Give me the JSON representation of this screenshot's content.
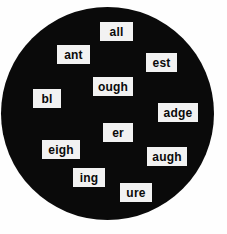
{
  "canvas": {
    "width": 227,
    "height": 234,
    "background_color": "#fefefe"
  },
  "circle": {
    "label": "black-circle-background",
    "color": "#0a0a0a",
    "center_x": 107,
    "center_y": 113,
    "diameter": 213
  },
  "tiles": [
    {
      "text": "all",
      "x": 100,
      "y": 22,
      "w": 33,
      "h": 19
    },
    {
      "text": "ant",
      "x": 57,
      "y": 45,
      "w": 33,
      "h": 19
    },
    {
      "text": "est",
      "x": 146,
      "y": 53,
      "w": 31,
      "h": 19
    },
    {
      "text": "ough",
      "x": 93,
      "y": 77,
      "w": 40,
      "h": 19
    },
    {
      "text": "bl",
      "x": 33,
      "y": 89,
      "w": 28,
      "h": 19
    },
    {
      "text": "adge",
      "x": 158,
      "y": 103,
      "w": 40,
      "h": 19
    },
    {
      "text": "er",
      "x": 103,
      "y": 123,
      "w": 30,
      "h": 19
    },
    {
      "text": "eigh",
      "x": 42,
      "y": 140,
      "w": 38,
      "h": 19
    },
    {
      "text": "augh",
      "x": 147,
      "y": 147,
      "w": 40,
      "h": 19
    },
    {
      "text": "ing",
      "x": 73,
      "y": 168,
      "w": 32,
      "h": 19
    },
    {
      "text": "ure",
      "x": 120,
      "y": 183,
      "w": 32,
      "h": 19
    }
  ],
  "tile_style": {
    "background_color": "#f2f2f2",
    "text_color": "#0a0a0a"
  }
}
